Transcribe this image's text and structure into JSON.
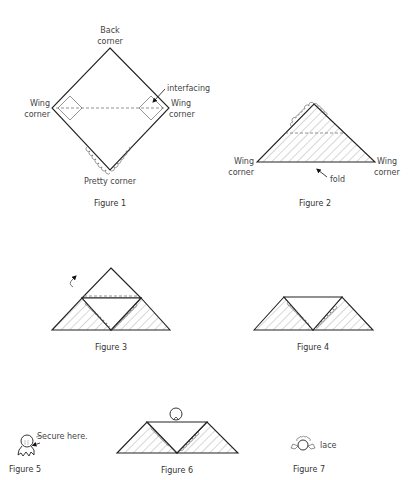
{
  "figures": {
    "fig1": {
      "caption": "Figure 1",
      "back_corner_line1": "Back",
      "back_corner_line2": "corner",
      "left_wing_line1": "Wing",
      "left_wing_line2": "corner",
      "right_wing_line1": "Wing",
      "right_wing_line2": "corner",
      "interfacing": "interfacing",
      "pretty_corner": "Pretty corner"
    },
    "fig2": {
      "caption": "Figure 2",
      "left_wing_line1": "Wing",
      "left_wing_line2": "corner",
      "right_wing_line1": "Wing",
      "right_wing_line2": "corner",
      "fold": "fold"
    },
    "fig3": {
      "caption": "Figure 3"
    },
    "fig4": {
      "caption": "Figure 4"
    },
    "fig5": {
      "caption": "Figure 5",
      "secure_here": "Secure here."
    },
    "fig6": {
      "caption": "Figure 6"
    },
    "fig7": {
      "caption": "Figure 7",
      "lace": "lace"
    }
  },
  "colors": {
    "line": "#222222",
    "text": "#444444",
    "background": "#ffffff"
  }
}
